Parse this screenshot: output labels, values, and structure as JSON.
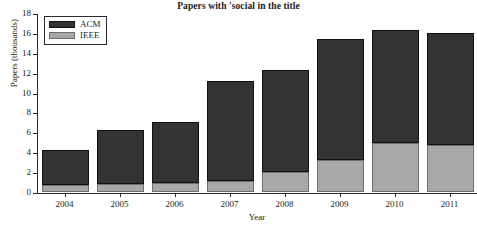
{
  "chart_data": {
    "type": "bar",
    "title": "Papers with 'social in the title",
    "xlabel": "Year",
    "ylabel": "Papers (thousands)",
    "categories": [
      "2004",
      "2005",
      "2006",
      "2007",
      "2008",
      "2009",
      "2010",
      "2011"
    ],
    "series": [
      {
        "name": "IEEE",
        "color": "#a8a8a8",
        "values": [
          0.7,
          0.8,
          0.9,
          1.1,
          2.0,
          3.2,
          4.9,
          4.7
        ]
      },
      {
        "name": "ACM",
        "color": "#333333",
        "values": [
          3.5,
          5.4,
          6.1,
          10.1,
          10.3,
          12.2,
          11.4,
          11.3
        ]
      }
    ],
    "totals": [
      4.2,
      6.2,
      7.0,
      11.2,
      12.3,
      15.4,
      16.3,
      16.0
    ],
    "stacked": true,
    "ylim": [
      0,
      18
    ],
    "yticks": [
      "0",
      "2",
      "4",
      "6",
      "8",
      "10",
      "12",
      "14",
      "16",
      "18"
    ],
    "ytick_values": [
      0,
      2,
      4,
      6,
      8,
      10,
      12,
      14,
      16,
      18
    ],
    "grid": false,
    "legend_position": "top-left",
    "legend_entries": [
      "ACM",
      "IEEE"
    ]
  }
}
